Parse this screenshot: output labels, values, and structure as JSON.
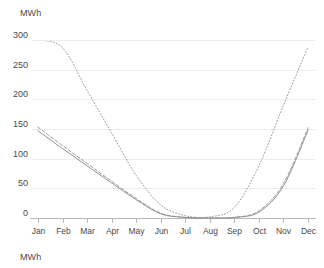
{
  "chart_data": {
    "type": "line",
    "title": "",
    "xlabel": "",
    "ylabel": "MWh",
    "unit_label_top": "MWh",
    "unit_label_bottom": "MWh",
    "categories": [
      "Jan",
      "Feb",
      "Mar",
      "Apr",
      "May",
      "Jun",
      "Jul",
      "Aug",
      "Sep",
      "Oct",
      "Nov",
      "Dec"
    ],
    "ylim": [
      0,
      300
    ],
    "yticks": [
      0,
      50,
      100,
      150,
      200,
      250,
      300
    ],
    "ytick_labels": [
      "0",
      "50",
      "100",
      "150",
      "200",
      "250",
      "300"
    ],
    "grid": true,
    "legend": "none",
    "series": [
      {
        "name": "series-dotted",
        "style": "dotted",
        "color": "#9a9a9a",
        "values": [
          300,
          287,
          215,
          143,
          72,
          22,
          4,
          2,
          18,
          88,
          190,
          288
        ]
      },
      {
        "name": "series-dashed",
        "style": "dashed",
        "color": "#8f8f8f",
        "values": [
          153,
          122,
          92,
          62,
          33,
          8,
          1,
          0,
          1,
          12,
          58,
          152
        ]
      },
      {
        "name": "series-solid",
        "style": "solid",
        "color": "#8f8f8f",
        "values": [
          147,
          117,
          88,
          59,
          31,
          7,
          1,
          0,
          1,
          10,
          54,
          148
        ]
      }
    ]
  },
  "axis": {
    "y_unit_top": "MWh",
    "y_unit_bottom": "MWh"
  },
  "colors": {
    "grid": "#ececed",
    "axis": "#b8b8b8",
    "text": "#4a4a4a",
    "series_dotted": "#9a9a9a",
    "series_line": "#8f8f8f",
    "background": "#ffffff"
  }
}
